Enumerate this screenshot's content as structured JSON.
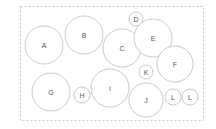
{
  "diagram": {
    "type": "circle-packing",
    "style": {
      "background": "#ffffff",
      "border_color": "#c8c8c8",
      "circle_stroke": "#c8c8c8",
      "circle_fill": "#ffffff",
      "label_color": "#555555"
    },
    "frame": {
      "x": 20,
      "y": 6,
      "width": 183,
      "height": 114
    },
    "circles": [
      {
        "label": "A",
        "cx": 44,
        "cy": 45,
        "r": 19
      },
      {
        "label": "B",
        "cx": 84,
        "cy": 35,
        "r": 19
      },
      {
        "label": "C",
        "cx": 122,
        "cy": 48,
        "r": 19
      },
      {
        "label": "D",
        "cx": 136,
        "cy": 19,
        "r": 7
      },
      {
        "label": "E",
        "cx": 153,
        "cy": 38,
        "r": 19
      },
      {
        "label": "F",
        "cx": 175,
        "cy": 64,
        "r": 18
      },
      {
        "label": "G",
        "cx": 51,
        "cy": 92,
        "r": 19
      },
      {
        "label": "H",
        "cx": 82,
        "cy": 95,
        "r": 8
      },
      {
        "label": "I",
        "cx": 110,
        "cy": 88,
        "r": 19
      },
      {
        "label": "J",
        "cx": 146,
        "cy": 100,
        "r": 17
      },
      {
        "label": "K",
        "cx": 146,
        "cy": 72,
        "r": 7
      },
      {
        "label": "L",
        "cx": 173,
        "cy": 97,
        "r": 8
      },
      {
        "label": "L",
        "cx": 190,
        "cy": 97,
        "r": 8
      }
    ]
  }
}
